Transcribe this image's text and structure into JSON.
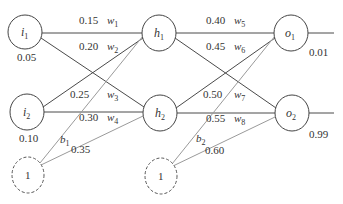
{
  "diagram": {
    "type": "neural-network",
    "colors": {
      "edge": "#4a4a4a",
      "bias_edge": "#9a9a9a",
      "node_stroke": "#444444"
    },
    "nodes": {
      "i1": {
        "name": "i",
        "sub": "1",
        "value": "0.05"
      },
      "i2": {
        "name": "i",
        "sub": "2",
        "value": "0.10"
      },
      "b1_node": {
        "name": "1"
      },
      "h1": {
        "name": "h",
        "sub": "1"
      },
      "h2": {
        "name": "h",
        "sub": "2"
      },
      "b2_node": {
        "name": "1"
      },
      "o1": {
        "name": "o",
        "sub": "1",
        "value": "0.01"
      },
      "o2": {
        "name": "o",
        "sub": "2",
        "value": "0.99"
      }
    },
    "weights": [
      {
        "var": "w",
        "sub": "1",
        "value": "0.15",
        "from": "i1",
        "to": "h1"
      },
      {
        "var": "w",
        "sub": "2",
        "value": "0.20",
        "from": "i1",
        "to": "h2"
      },
      {
        "var": "w",
        "sub": "3",
        "value": "0.25",
        "from": "i2",
        "to": "h1"
      },
      {
        "var": "w",
        "sub": "4",
        "value": "0.30",
        "from": "i2",
        "to": "h2"
      },
      {
        "var": "w",
        "sub": "5",
        "value": "0.40",
        "from": "h1",
        "to": "o1"
      },
      {
        "var": "w",
        "sub": "6",
        "value": "0.45",
        "from": "h1",
        "to": "o2"
      },
      {
        "var": "w",
        "sub": "7",
        "value": "0.50",
        "from": "h2",
        "to": "o1"
      },
      {
        "var": "w",
        "sub": "8",
        "value": "0.55",
        "from": "h2",
        "to": "o2"
      }
    ],
    "biases": [
      {
        "var": "b",
        "sub": "1",
        "value": "0.35",
        "to": [
          "h1",
          "h2"
        ]
      },
      {
        "var": "b",
        "sub": "2",
        "value": "0.60",
        "to": [
          "o1",
          "o2"
        ]
      }
    ]
  }
}
